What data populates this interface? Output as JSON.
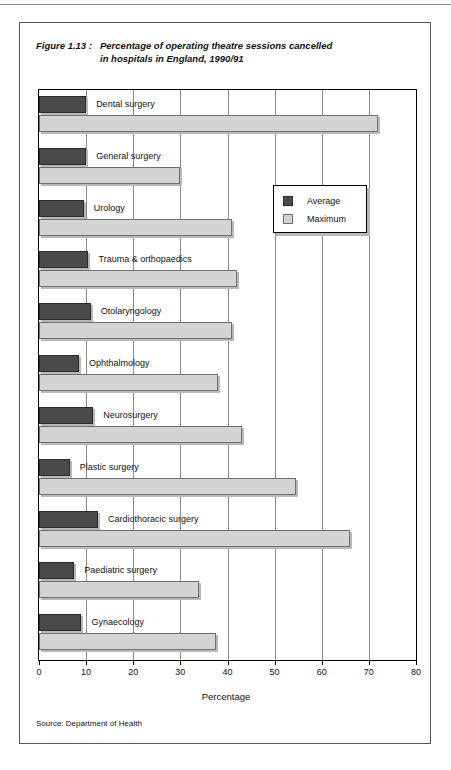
{
  "figure": {
    "label": "Figure 1.13 :",
    "title_line1": "Percentage of operating theatre sessions cancelled",
    "title_line2": "in hospitals in England, 1990/91",
    "source": "Source: Department of Health"
  },
  "legend": {
    "items": [
      {
        "name": "Average",
        "color": "#4a4a4a"
      },
      {
        "name": "Maximum",
        "color": "#d4d4d4"
      }
    ]
  },
  "axis": {
    "x_title": "Percentage",
    "ticks": [
      "0",
      "10",
      "20",
      "30",
      "40",
      "50",
      "60",
      "70",
      "80"
    ]
  },
  "chart_data": {
    "type": "bar",
    "orientation": "horizontal",
    "xlabel": "Percentage",
    "ylabel": "",
    "xlim": [
      0,
      80
    ],
    "xticks": [
      0,
      10,
      20,
      30,
      40,
      50,
      60,
      70,
      80
    ],
    "grid": "vertical",
    "legend_position": "inside-right-upper",
    "categories": [
      "Dental surgery",
      "General surgery",
      "Urology",
      "Trauma & orthopaedics",
      "Otolaryngology",
      "Ophthalmology",
      "Neurosurgery",
      "Plastic surgery",
      "Cardiothoracic surgery",
      "Paediatric surgery",
      "Gynaecology"
    ],
    "series": [
      {
        "name": "Average",
        "color": "#4a4a4a",
        "values": [
          10,
          10,
          9.5,
          10.5,
          11,
          8.5,
          11.5,
          6.5,
          12.5,
          7.5,
          9
        ]
      },
      {
        "name": "Maximum",
        "color": "#d4d4d4",
        "values": [
          72,
          30,
          41,
          42,
          41,
          38,
          43,
          54.5,
          66,
          34,
          37.5
        ]
      }
    ]
  }
}
